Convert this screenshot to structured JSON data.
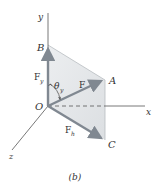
{
  "figure": {
    "caption": "(b)",
    "axes": {
      "y_label": "y",
      "x_label": "x",
      "z_label": "z"
    },
    "points": {
      "origin": "O",
      "A": "A",
      "B": "B",
      "C": "C"
    },
    "vectors": {
      "F_label": "F",
      "Fy_label": "F",
      "Fy_sub": "y",
      "Fh_label": "F",
      "Fh_sub": "h"
    },
    "angle": {
      "symbol": "θ",
      "sub": "y"
    },
    "colors": {
      "vector": "#808891",
      "plane_fill": "#e4e6e8",
      "axis": "#555555",
      "text": "#333333"
    }
  }
}
